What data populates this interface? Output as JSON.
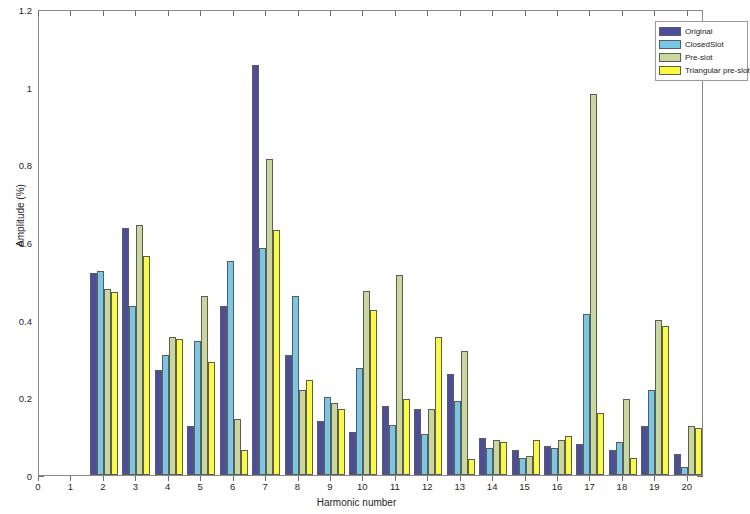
{
  "chart_data": {
    "type": "bar",
    "title": "",
    "xlabel": "Harmonic number",
    "ylabel": "Amplitude (%)",
    "xlim": [
      0,
      20.5
    ],
    "ylim": [
      0,
      1.2
    ],
    "ytick_labels": [
      "0",
      "0.2",
      "0.4",
      "0.6",
      "0.8",
      "1",
      "1.2"
    ],
    "ytick_values": [
      0,
      0.2,
      0.4,
      0.6,
      0.8,
      1,
      1.2
    ],
    "xtick_labels": [
      "0",
      "1",
      "2",
      "3",
      "4",
      "5",
      "6",
      "7",
      "8",
      "9",
      "10",
      "11",
      "12",
      "13",
      "14",
      "15",
      "16",
      "17",
      "18",
      "19",
      "20"
    ],
    "xtick_values": [
      0,
      1,
      2,
      3,
      4,
      5,
      6,
      7,
      8,
      9,
      10,
      11,
      12,
      13,
      14,
      15,
      16,
      17,
      18,
      19,
      20
    ],
    "grid": false,
    "legend_position": "top-right",
    "categories": [
      2,
      3,
      4,
      5,
      6,
      7,
      8,
      9,
      10,
      11,
      12,
      13,
      14,
      15,
      16,
      17,
      18,
      19,
      20
    ],
    "series": [
      {
        "name": "Original",
        "color": "#4d4d9e",
        "values": [
          0.52,
          0.635,
          0.27,
          0.125,
          0.435,
          1.055,
          0.31,
          0.14,
          0.11,
          0.178,
          0.17,
          0.26,
          0.095,
          0.065,
          0.075,
          0.08,
          0.065,
          0.125,
          0.055
        ]
      },
      {
        "name": "ClosedSlot",
        "color": "#77c8e8",
        "values": [
          0.525,
          0.435,
          0.31,
          0.345,
          0.55,
          0.585,
          0.46,
          0.2,
          0.275,
          0.13,
          0.105,
          0.19,
          0.07,
          0.045,
          0.07,
          0.415,
          0.085,
          0.22,
          0.02
        ]
      },
      {
        "name": "Pre-slot",
        "color": "#c8d89a",
        "values": [
          0.48,
          0.645,
          0.355,
          0.46,
          0.145,
          0.815,
          0.22,
          0.185,
          0.475,
          0.515,
          0.17,
          0.32,
          0.09,
          0.05,
          0.09,
          0.98,
          0.195,
          0.4,
          0.125
        ]
      },
      {
        "name": "Triangular pre-slot",
        "color": "#fbfb3c",
        "values": [
          0.47,
          0.565,
          0.35,
          0.29,
          0.065,
          0.63,
          0.245,
          0.17,
          0.425,
          0.195,
          0.355,
          0.04,
          0.085,
          0.09,
          0.1,
          0.16,
          0.045,
          0.385,
          0.12
        ]
      }
    ]
  },
  "legend": {
    "items": [
      {
        "label": "Original",
        "color": "#4d4d9e"
      },
      {
        "label": "ClosedSlot",
        "color": "#77c8e8"
      },
      {
        "label": "Pre-slot",
        "color": "#c8d89a"
      },
      {
        "label": "Triangular pre-slot",
        "color": "#fbfb3c"
      }
    ]
  },
  "axes": {
    "x_title": "Harmonic number",
    "y_title": "Amplitude (%)"
  }
}
